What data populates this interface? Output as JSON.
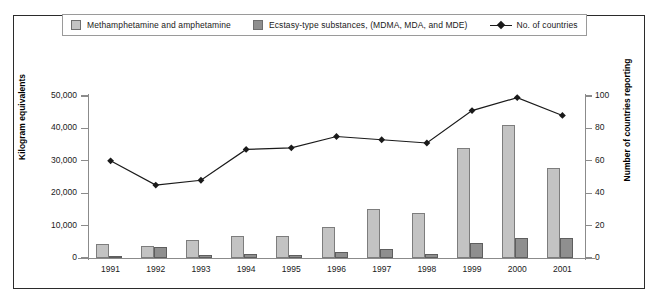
{
  "chart_data": {
    "type": "bar",
    "title": "",
    "subtitle": "",
    "categories": [
      "1991",
      "1992",
      "1993",
      "1994",
      "1995",
      "1996",
      "1997",
      "1998",
      "1999",
      "2000",
      "2001"
    ],
    "xlabel": "",
    "ylabel": "Kilogram equivalents",
    "ylabel_secondary": "Number of countries reporting",
    "ylim": [
      0,
      50000
    ],
    "ylim_secondary": [
      0,
      100
    ],
    "yticks": [
      "0",
      "10,000",
      "20,000",
      "30,000",
      "40,000",
      "50,000"
    ],
    "ytick_values": [
      0,
      10000,
      20000,
      30000,
      40000,
      50000
    ],
    "yticks_secondary": [
      "0",
      "20",
      "40",
      "60",
      "80",
      "100"
    ],
    "ytick_values_secondary": [
      0,
      20,
      40,
      60,
      80,
      100
    ],
    "grid": false,
    "legend_position": "top",
    "series": [
      {
        "name": "Methamphetamine and amphetamine",
        "type": "bar",
        "axis": "left",
        "color": "#c3c3c3",
        "values": [
          4200,
          3700,
          5500,
          6900,
          6700,
          9500,
          15000,
          13900,
          34000,
          41200,
          27800
        ]
      },
      {
        "name": "Ecstasy-type substances, (MDMA, MDA, and MDE)",
        "type": "bar",
        "axis": "left",
        "color": "#8f8f8f",
        "values": [
          500,
          3500,
          800,
          1200,
          1000,
          1800,
          2700,
          1100,
          4600,
          6100,
          6200
        ]
      },
      {
        "name": "No. of countries",
        "type": "line",
        "axis": "right",
        "color": "#1a1a1a",
        "values": [
          60,
          45,
          48,
          67,
          68,
          75,
          73,
          71,
          91,
          99,
          88
        ]
      }
    ]
  },
  "legend": {
    "items": [
      {
        "label": "Methamphetamine and amphetamine",
        "marker": "swatch",
        "color": "#c3c3c3"
      },
      {
        "label": "Ecstasy-type substances, (MDMA, MDA, and MDE)",
        "marker": "swatch",
        "color": "#8f8f8f"
      },
      {
        "label": "No. of countries",
        "marker": "line-diamond",
        "color": "#1a1a1a"
      }
    ]
  },
  "axes": {
    "left_title": "Kilogram equivalents",
    "right_title": "Number of countries reporting"
  }
}
